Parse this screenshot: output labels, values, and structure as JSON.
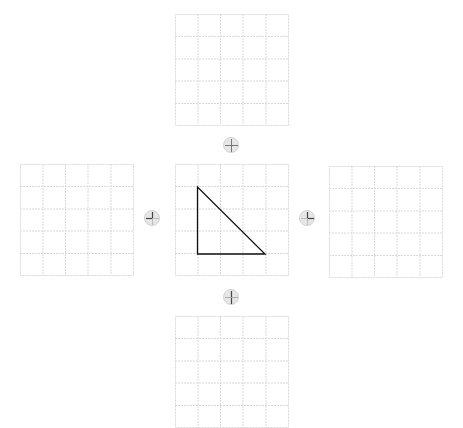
{
  "diagram": {
    "grid": {
      "rows": 5,
      "cols": 5,
      "line_color": "#d9d9d9",
      "line_style": "dotted"
    },
    "triangle": {
      "stroke": "#111111",
      "grid_vertices": [
        [
          1,
          1
        ],
        [
          1,
          4
        ],
        [
          4,
          4
        ]
      ]
    },
    "grids": [
      {
        "id": "top",
        "x": 175,
        "y": 14
      },
      {
        "id": "left",
        "x": 20,
        "y": 164
      },
      {
        "id": "center",
        "x": 175,
        "y": 164
      },
      {
        "id": "right",
        "x": 329,
        "y": 166
      },
      {
        "id": "bottom",
        "x": 175,
        "y": 316
      }
    ],
    "buttons": [
      {
        "id": "top",
        "icon": "reflect-vertical-cross-icon",
        "x": 223,
        "y": 137
      },
      {
        "id": "left",
        "icon": "rotate-left-icon",
        "x": 144,
        "y": 210
      },
      {
        "id": "right",
        "icon": "rotate-right-icon",
        "x": 299,
        "y": 210
      },
      {
        "id": "bottom",
        "icon": "reflect-horizontal-icon",
        "x": 223,
        "y": 289
      }
    ],
    "colors": {
      "button_fill": "#e6e6e6",
      "button_border": "#d2d2d2",
      "glyph": "#888888",
      "glyph_dark": "#555555"
    }
  }
}
